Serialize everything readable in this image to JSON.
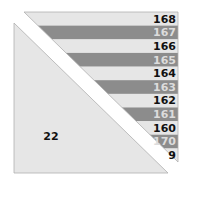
{
  "diagram": {
    "type": "quilt-block-cutting-diagram",
    "colors": {
      "light_fill": "#e6e6e6",
      "dark_fill": "#8c8c8c",
      "dark_text": "#111111",
      "light_text": "#dcdcdc",
      "outline": "#b0b0b0",
      "background": "#ffffff"
    },
    "strip_triangle": {
      "strips": [
        {
          "label": "168",
          "shade": "light"
        },
        {
          "label": "167",
          "shade": "dark"
        },
        {
          "label": "166",
          "shade": "light"
        },
        {
          "label": "165",
          "shade": "dark"
        },
        {
          "label": "164",
          "shade": "light"
        },
        {
          "label": "163",
          "shade": "dark"
        },
        {
          "label": "162",
          "shade": "light"
        },
        {
          "label": "161",
          "shade": "dark"
        },
        {
          "label": "160",
          "shade": "light"
        },
        {
          "label": "170",
          "shade": "dark"
        },
        {
          "label": "9",
          "shade": "light"
        }
      ]
    },
    "solid_triangle": {
      "label": "22"
    }
  }
}
